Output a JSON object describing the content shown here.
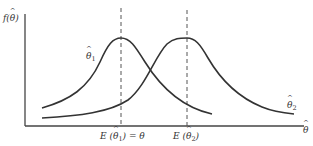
{
  "diagram": {
    "type": "probability-density-comparison",
    "y_axis_label": "f(θ̂)",
    "x_axis_label": "θ̂",
    "curves": [
      {
        "name": "theta-hat-1",
        "label_symbol": "θ",
        "label_sub": "1",
        "peak_x": 120,
        "description": "unbiased estimator density centered at θ"
      },
      {
        "name": "theta-hat-2",
        "label_symbol": "θ",
        "label_sub": "2",
        "peak_x": 186,
        "description": "biased estimator density centered at E(θ̂2)"
      }
    ],
    "markers": [
      {
        "label_prefix": "E (",
        "symbol": "θ",
        "sub": "1",
        "label_suffix": ") = θ",
        "x": 120
      },
      {
        "label_prefix": "E (",
        "symbol": "θ",
        "sub": "2",
        "label_suffix": ")",
        "x": 186
      }
    ],
    "colors": {
      "curve": "#333333",
      "axis": "#444444",
      "dashed": "#555555",
      "background": "#ffffff"
    }
  }
}
